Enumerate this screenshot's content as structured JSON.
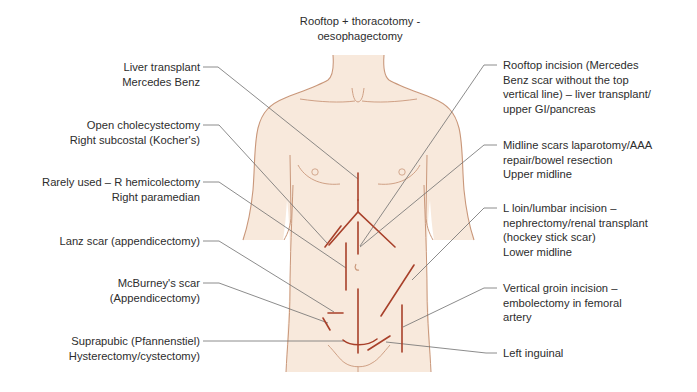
{
  "title": {
    "line1": "Rooftop + thoracotomy -",
    "line2": "oesophagectomy"
  },
  "colors": {
    "skin": "#f8e9dc",
    "outline": "#c9977a",
    "scar": "#a8402a",
    "leader": "#6e6e6e",
    "text": "#2d2d2d"
  },
  "labels_left": [
    {
      "id": "liver-transplant",
      "lines": [
        "Liver transplant",
        "Mercedes Benz"
      ]
    },
    {
      "id": "open-cholecystectomy",
      "lines": [
        "Open cholecystectomy",
        "Right subcostal (Kocher's)"
      ]
    },
    {
      "id": "right-paramedian",
      "lines": [
        "Rarely used – R hemicolectomy",
        "Right paramedian"
      ]
    },
    {
      "id": "lanz-scar",
      "lines": [
        "Lanz scar (appendicectomy)"
      ]
    },
    {
      "id": "mcburney-scar",
      "lines": [
        "McBurney's  scar",
        "(Appendicectomy)"
      ]
    },
    {
      "id": "suprapubic",
      "lines": [
        "Suprapubic (Pfannenstiel)",
        "Hysterectomy/cystectomy)"
      ]
    }
  ],
  "labels_right": [
    {
      "id": "rooftop-incision",
      "lines": [
        "Rooftop incision (Mercedes",
        "Benz scar without the top",
        "vertical line) – liver transplant/",
        "upper GI/pancreas"
      ]
    },
    {
      "id": "midline-scars",
      "lines": [
        "Midline scars  laparotomy/AAA",
        "repair/bowel resection",
        "Upper midline"
      ]
    },
    {
      "id": "loin-lumbar",
      "lines": [
        "L loin/lumbar incision –",
        "nephrectomy/renal transplant",
        "(hockey stick scar)",
        "Lower midline"
      ]
    },
    {
      "id": "vertical-groin",
      "lines": [
        "Vertical groin incision –",
        "embolectomy in femoral",
        "artery"
      ]
    },
    {
      "id": "left-inguinal",
      "lines": [
        "Left inguinal"
      ]
    }
  ]
}
